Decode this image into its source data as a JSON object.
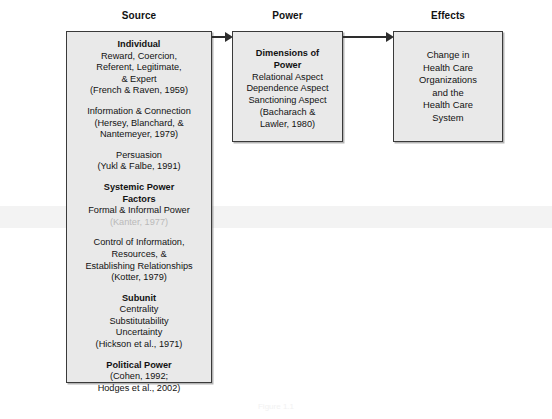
{
  "diagram": {
    "columns": {
      "source": "Source",
      "power": "Power",
      "effects": "Effects"
    },
    "source_box": {
      "groups": [
        {
          "heading": "Individual",
          "lines": [
            "Reward, Coercion,",
            "Referent, Legitimate,",
            "& Expert"
          ],
          "citation": "(French & Raven, 1959)"
        },
        {
          "heading": "",
          "lines": [
            "Information & Connection"
          ],
          "citation": "(Hersey, Blanchard, &",
          "citation2": "Nantemeyer, 1979)"
        },
        {
          "heading": "",
          "lines": [
            "Persuasion"
          ],
          "citation": "(Yukl & Falbe, 1991)"
        },
        {
          "heading": "Systemic Power",
          "heading2": "Factors",
          "lines": [
            "Formal & Informal Power"
          ],
          "citation": "(Kanter, 1977)"
        },
        {
          "heading": "",
          "lines": [
            "Control of Information,",
            "Resources, &",
            "Establishing Relationships"
          ],
          "citation": "(Kotter, 1979)"
        },
        {
          "heading": "Subunit",
          "lines": [
            "Centrality",
            "Substitutability",
            "Uncertainty"
          ],
          "citation": "(Hickson et al., 1971)"
        },
        {
          "heading": "Political Power",
          "lines": [],
          "citation": "(Cohen, 1992;",
          "citation2": "Hodges et al., 2002)"
        }
      ]
    },
    "power_box": {
      "heading": "Dimensions of",
      "heading2": "Power",
      "lines": [
        "Relational Aspect",
        "Dependence Aspect",
        "Sanctioning Aspect"
      ],
      "citation": "(Bacharach &",
      "citation2": "Lawler, 1980)"
    },
    "effects_box": {
      "lines": [
        "Change in",
        "Health Care",
        "Organizations",
        "and the",
        "Health Care",
        "System"
      ]
    },
    "arrows": [
      {
        "name": "source-to-power",
        "from": "Source",
        "to": "Power"
      },
      {
        "name": "power-to-effects",
        "from": "Power",
        "to": "Effects"
      }
    ],
    "caption": "Figure 1.1"
  }
}
